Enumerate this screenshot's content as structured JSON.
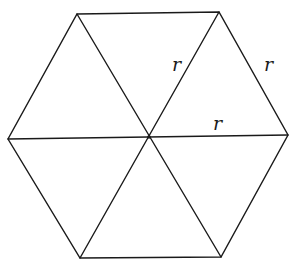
{
  "diagram": {
    "type": "regular-hexagon-divided-into-equilateral-triangles",
    "vertices": {
      "top_left": [
        77,
        14
      ],
      "top_right": [
        219,
        12
      ],
      "right": [
        288,
        135
      ],
      "bottom_right": [
        221,
        257
      ],
      "bottom_left": [
        80,
        258
      ],
      "left": [
        8,
        139
      ]
    },
    "center": [
      149,
      137
    ],
    "labels": [
      {
        "text": "r",
        "x": 172,
        "y": 71,
        "refers_to": "center-to-top-right radius"
      },
      {
        "text": "r",
        "x": 264,
        "y": 71,
        "refers_to": "right outer edge (top-right to right)"
      },
      {
        "text": "r",
        "x": 213,
        "y": 130,
        "refers_to": "center-to-right radius"
      }
    ]
  }
}
